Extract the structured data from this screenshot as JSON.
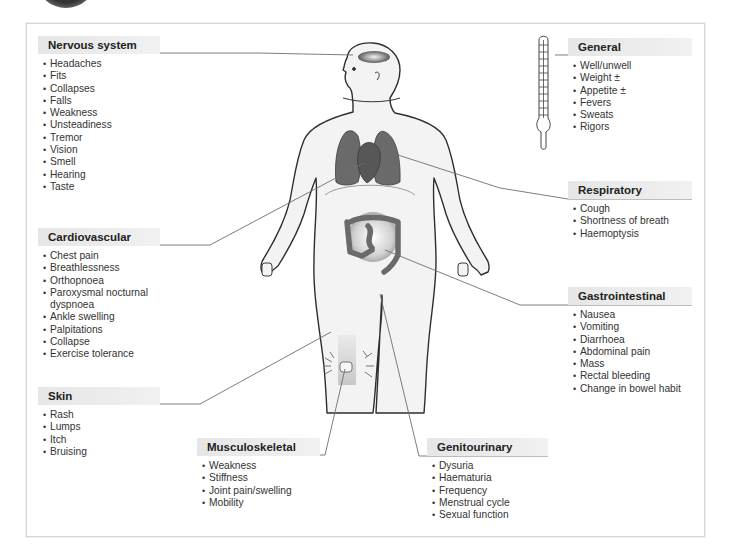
{
  "figure": {
    "colors": {
      "frame_border": "#d6d6d6",
      "header_bg": "#e8e8e8",
      "header_rule": "#8a8a8a",
      "connector_line": "#6a6a6a",
      "organ_dark": "#6b6b6b",
      "skin_fill": "#f2f2f2",
      "body_outline": "#333333"
    }
  },
  "panels": {
    "nervous": {
      "title": "Nervous system",
      "items": [
        "Headaches",
        "Fits",
        "Collapses",
        "Falls",
        "Weakness",
        "Unsteadiness",
        "Tremor",
        "Vision",
        "Smell",
        "Hearing",
        "Taste"
      ]
    },
    "general": {
      "title": "General",
      "items": [
        "Well/unwell",
        "Weight ±",
        "Appetite ±",
        "Fevers",
        "Sweats",
        "Rigors"
      ]
    },
    "respiratory": {
      "title": "Respiratory",
      "items": [
        "Cough",
        "Shortness of breath",
        "Haemoptysis"
      ]
    },
    "cardiovascular": {
      "title": "Cardiovascular",
      "items": [
        "Chest pain",
        "Breathlessness",
        "Orthopnoea",
        "Paroxysmal nocturnal",
        "dyspnoea",
        "Ankle swelling",
        "Palpitations",
        "Collapse",
        "Exercise tolerance"
      ]
    },
    "gastrointestinal": {
      "title": "Gastrointestinal",
      "items": [
        "Nausea",
        "Vomiting",
        "Diarrhoea",
        "Abdominal pain",
        "Mass",
        "Rectal bleeding",
        "Change in bowel habit"
      ]
    },
    "skin": {
      "title": "Skin",
      "items": [
        "Rash",
        "Lumps",
        "Itch",
        "Bruising"
      ]
    },
    "musculoskeletal": {
      "title": "Musculoskeletal",
      "items": [
        "Weakness",
        "Stiffness",
        "Joint pain/swelling",
        "Mobility"
      ]
    },
    "genitourinary": {
      "title": "Genitourinary",
      "items": [
        "Dysuria",
        "Haematuria",
        "Frequency",
        "Menstrual cycle",
        "Sexual function"
      ]
    }
  },
  "icons": {
    "thermometer": "thermometer-icon",
    "body": "human-body-figure"
  }
}
